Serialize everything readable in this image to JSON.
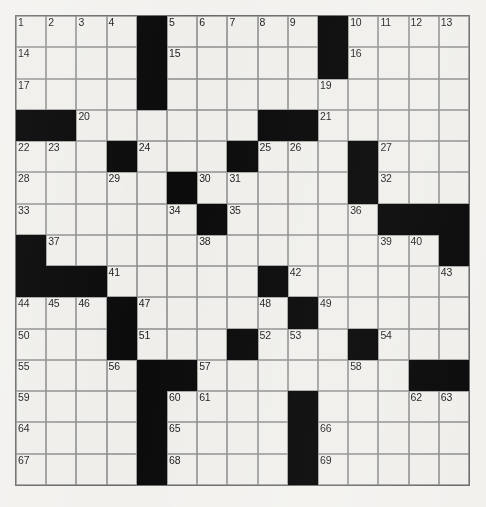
{
  "puzzle": {
    "type": "crossword-grid",
    "rows": 15,
    "columns": 15,
    "colors": {
      "block": "#0c0c0c",
      "cell": "#efeeea",
      "gridline": "#8d8d8d",
      "page_background": "#f2f1ee",
      "number_text": "#1a1a1a"
    },
    "blocks": [
      [
        0,
        4
      ],
      [
        0,
        10
      ],
      [
        1,
        4
      ],
      [
        1,
        10
      ],
      [
        2,
        4
      ],
      [
        3,
        0
      ],
      [
        3,
        1
      ],
      [
        3,
        8
      ],
      [
        3,
        9
      ],
      [
        4,
        3
      ],
      [
        4,
        7
      ],
      [
        4,
        11
      ],
      [
        5,
        5
      ],
      [
        5,
        11
      ],
      [
        6,
        6
      ],
      [
        6,
        12
      ],
      [
        6,
        13
      ],
      [
        6,
        14
      ],
      [
        7,
        0
      ],
      [
        7,
        14
      ],
      [
        8,
        0
      ],
      [
        8,
        1
      ],
      [
        8,
        2
      ],
      [
        8,
        8
      ],
      [
        9,
        3
      ],
      [
        9,
        9
      ],
      [
        10,
        3
      ],
      [
        10,
        7
      ],
      [
        10,
        11
      ],
      [
        11,
        4
      ],
      [
        11,
        5
      ],
      [
        11,
        13
      ],
      [
        11,
        14
      ],
      [
        12,
        4
      ],
      [
        12,
        9
      ],
      [
        13,
        4
      ],
      [
        13,
        9
      ],
      [
        14,
        4
      ],
      [
        14,
        9
      ]
    ],
    "numbers": {
      "0_0": "1",
      "0_1": "2",
      "0_2": "3",
      "0_3": "4",
      "0_5": "5",
      "0_6": "6",
      "0_7": "7",
      "0_8": "8",
      "0_9": "9",
      "0_11": "10",
      "0_12": "11",
      "0_13": "12",
      "0_14": "13",
      "1_0": "14",
      "1_5": "15",
      "1_11": "16",
      "2_0": "17",
      "2_4": "18",
      "2_10": "19",
      "3_2": "20",
      "3_10": "21",
      "4_0": "22",
      "4_1": "23",
      "4_4": "24",
      "4_8": "25",
      "4_9": "26",
      "4_12": "27",
      "5_0": "28",
      "5_3": "29",
      "5_6": "30",
      "5_7": "31",
      "5_12": "32",
      "6_0": "33",
      "6_5": "34",
      "6_7": "35",
      "6_11": "36",
      "7_1": "37",
      "7_6": "38",
      "7_12": "39",
      "7_13": "40",
      "8_3": "41",
      "8_9": "42",
      "8_14": "43",
      "9_0": "44",
      "9_1": "45",
      "9_2": "46",
      "9_4": "47",
      "9_8": "48",
      "9_10": "49",
      "10_0": "50",
      "10_4": "51",
      "10_8": "52",
      "10_9": "53",
      "10_12": "54",
      "11_0": "55",
      "11_3": "56",
      "11_6": "57",
      "11_11": "58",
      "12_0": "59",
      "12_5": "60",
      "12_6": "61",
      "12_13": "62",
      "12_14": "63",
      "13_0": "64",
      "13_5": "65",
      "13_10": "66",
      "14_0": "67",
      "14_5": "68",
      "14_10": "69"
    },
    "letters": {}
  }
}
